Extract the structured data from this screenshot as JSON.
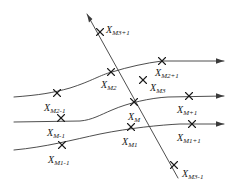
{
  "figure": {
    "background_color": "#ffffff",
    "line_color": "#3a3a3a",
    "text_color": "#1a1a1a",
    "marker": "x-cross"
  },
  "labels": [
    {
      "id": "x-m3-plus-1",
      "base": "X",
      "sub": "M3+1",
      "x": 106,
      "y": 25
    },
    {
      "id": "x-m2-plus-1",
      "base": "X",
      "sub": "M2+1",
      "x": 155,
      "y": 68
    },
    {
      "id": "x-m2",
      "base": "X",
      "sub": "M2",
      "x": 101,
      "y": 80
    },
    {
      "id": "x-m3",
      "base": "X",
      "sub": "M3",
      "x": 150,
      "y": 83
    },
    {
      "id": "x-m2-minus-1",
      "base": "X",
      "sub": "M2-1",
      "x": 44,
      "y": 103
    },
    {
      "id": "x-m",
      "base": "X",
      "sub": "M",
      "x": 128,
      "y": 112
    },
    {
      "id": "x-m-plus-1",
      "base": "X",
      "sub": "M+1",
      "x": 177,
      "y": 105
    },
    {
      "id": "x-m-minus-1",
      "base": "X",
      "sub": "M-1",
      "x": 47,
      "y": 128
    },
    {
      "id": "x-m1",
      "base": "X",
      "sub": "M1",
      "x": 122,
      "y": 137
    },
    {
      "id": "x-m1-plus-1",
      "base": "X",
      "sub": "M1+1",
      "x": 177,
      "y": 133
    },
    {
      "id": "x-m1-minus-1",
      "base": "X",
      "sub": "M1-1",
      "x": 48,
      "y": 155
    },
    {
      "id": "x-m3-minus-1",
      "base": "X",
      "sub": "M3-1",
      "x": 182,
      "y": 169
    }
  ],
  "markers": [
    {
      "id": "marker-x-m3-plus-1",
      "x": 100,
      "y": 32
    },
    {
      "id": "marker-x-m2-plus-1",
      "x": 162,
      "y": 61
    },
    {
      "id": "marker-x-m2",
      "x": 111,
      "y": 72
    },
    {
      "id": "marker-x-m3",
      "x": 143,
      "y": 80
    },
    {
      "id": "marker-x-m2-minus-1",
      "x": 57,
      "y": 93
    },
    {
      "id": "marker-x-m",
      "x": 134,
      "y": 102
    },
    {
      "id": "marker-x-m-plus-1",
      "x": 189,
      "y": 96
    },
    {
      "id": "marker-x-m-minus-1",
      "x": 61,
      "y": 118
    },
    {
      "id": "marker-x-m1",
      "x": 131,
      "y": 127
    },
    {
      "id": "marker-x-m1-plus-1",
      "x": 192,
      "y": 124
    },
    {
      "id": "marker-x-m1-minus-1",
      "x": 62,
      "y": 145
    },
    {
      "id": "marker-x-m3-minus-1",
      "x": 174,
      "y": 165
    }
  ],
  "curves": [
    {
      "id": "upper-characteristic-curve",
      "path": "M 14,97 C 40,95 52,93 70,88 C 92,81 100,75 112,72 C 128,67 146,63 162,61 L 224,61"
    },
    {
      "id": "middle-characteristic-curve",
      "path": "M 14,122 L 80,121 C 92,120 100,115 112,110 C 128,103 150,98 168,97 L 224,96"
    },
    {
      "id": "lower-characteristic-curve",
      "path": "M 14,150 C 46,147 72,140 100,134 C 130,128 160,125 180,124 L 224,124"
    },
    {
      "id": "diagonal-characteristic-curve",
      "path": "M 87,14 L 178,178"
    }
  ],
  "arrows": [
    {
      "id": "arrow-upper-right",
      "x": 224,
      "y": 61,
      "direction": "right"
    },
    {
      "id": "arrow-middle-right",
      "x": 224,
      "y": 96,
      "direction": "right"
    },
    {
      "id": "arrow-lower-right",
      "x": 224,
      "y": 124,
      "direction": "right"
    },
    {
      "id": "arrow-diagonal-upleft",
      "x": 87,
      "y": 14,
      "direction": "up-left"
    }
  ]
}
